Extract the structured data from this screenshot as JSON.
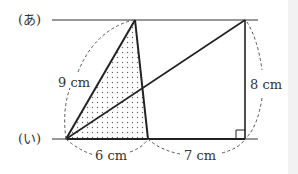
{
  "diagram": {
    "line_labels": {
      "top": "(あ)",
      "bottom": "(い)"
    },
    "measurements": {
      "left_side": "9 cm",
      "bottom_left": "6 cm",
      "bottom_right": "7 cm",
      "right_side": "8 cm"
    },
    "colors": {
      "line": "#222222",
      "dash": "#555555",
      "dots": "#666666"
    }
  }
}
